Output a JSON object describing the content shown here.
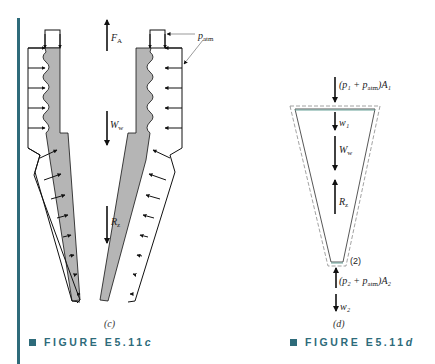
{
  "figure_c": {
    "labels": {
      "force_a": "F",
      "force_a_sub": "A",
      "weight_water": "W",
      "weight_water_sub": "w",
      "reaction_z": "R",
      "reaction_z_sub": "z",
      "p_atm": "p",
      "p_atm_sub": "atm"
    },
    "panel_label": "(c)",
    "caption": "FIGURE E5.11",
    "caption_suffix": "c"
  },
  "figure_d": {
    "labels": {
      "top_force": "(p₁ + p",
      "top_force_sub": "atm",
      "top_force_end": ")A₁",
      "w1": "w₁",
      "weight_water": "W",
      "weight_water_sub": "w",
      "reaction_z": "R",
      "reaction_z_sub": "z",
      "section_2": "(2)",
      "bottom_force": "(p₂ + p",
      "bottom_force_sub": "atm",
      "bottom_force_end": ")A₂",
      "w2": "w₂"
    },
    "panel_label": "(d)",
    "caption": "FIGURE E5.11",
    "caption_suffix": "d"
  },
  "colors": {
    "accent": "#2e6b7a",
    "nozzle_fill": "#b5b5b5",
    "control_volume": "#6aa39a"
  }
}
